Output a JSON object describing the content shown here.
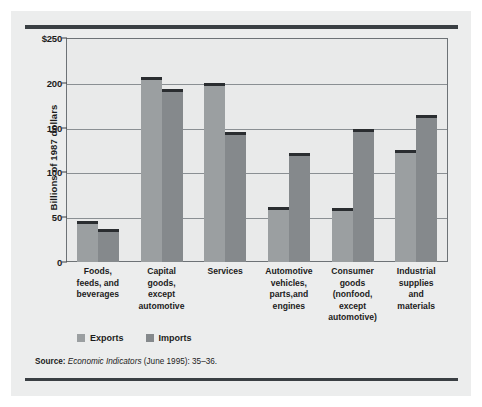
{
  "chart_data": {
    "type": "bar",
    "title": "",
    "xlabel": "",
    "ylabel": "Billions of 1987 dollars",
    "ylim": [
      0,
      250
    ],
    "yticks": [
      "$250",
      "200",
      "150",
      "100",
      "50",
      "0"
    ],
    "ytick_values": [
      250,
      200,
      150,
      100,
      50,
      0
    ],
    "grid": true,
    "legend_position": "bottom-left",
    "categories": [
      "Foods, feeds, and beverages",
      "Capital goods, except automotive",
      "Services",
      "Automotive vehicles, parts,and engines",
      "Consumer goods (nonfood, except automotive)",
      "Industrial supplies and materials"
    ],
    "category_lines": [
      [
        "Foods,",
        "feeds, and",
        "beverages"
      ],
      [
        "Capital",
        "goods,",
        "except",
        "automotive"
      ],
      [
        "Services"
      ],
      [
        "Automotive",
        "vehicles,",
        "parts,and",
        "engines"
      ],
      [
        "Consumer",
        "goods",
        "(nonfood,",
        "except",
        "automotive)"
      ],
      [
        "Industrial",
        "supplies",
        "and",
        "materials"
      ]
    ],
    "series": [
      {
        "name": "Exports",
        "values": [
          46,
          207,
          200,
          61,
          60,
          125
        ],
        "color": "#9b9fa1"
      },
      {
        "name": "Imports",
        "values": [
          37,
          193,
          145,
          122,
          149,
          164
        ],
        "color": "#85898c"
      }
    ]
  },
  "legend": {
    "items": [
      {
        "label": "Exports"
      },
      {
        "label": "Imports"
      }
    ]
  },
  "source": {
    "label": "Source:",
    "title": "Economic Indicators",
    "detail": "(June 1995): 35–36."
  }
}
